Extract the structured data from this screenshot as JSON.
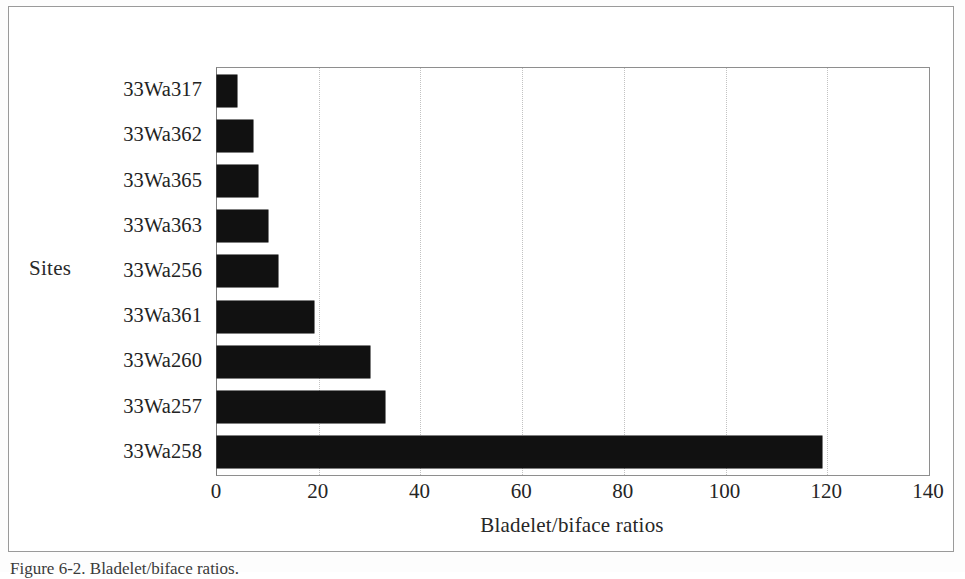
{
  "figure": {
    "caption": "Figure 6-2. Bladelet/biface ratios.",
    "frame_color": "#9a9a9a",
    "bar_color": "#111111",
    "gridline_color": "#c2c2c2",
    "background": "#ffffff"
  },
  "chart_data": {
    "type": "bar",
    "orientation": "horizontal",
    "title": "",
    "xlabel": "Bladelet/biface ratios",
    "ylabel": "Sites",
    "categories": [
      "33Wa317",
      "33Wa362",
      "33Wa365",
      "33Wa363",
      "33Wa256",
      "33Wa361",
      "33Wa260",
      "33Wa257",
      "33Wa258"
    ],
    "values": [
      4,
      7,
      8,
      10,
      12,
      19,
      30,
      33,
      119
    ],
    "xlim": [
      0,
      140
    ],
    "xticks": [
      0,
      20,
      40,
      60,
      80,
      100,
      120,
      140
    ],
    "xtick_labels": [
      "0",
      "20",
      "40",
      "60",
      "80",
      "100",
      "120",
      "140"
    ],
    "grid": true,
    "grid_axis": "x",
    "grid_style": "dotted",
    "legend": false,
    "series": [
      {
        "name": "Bladelet/biface ratio",
        "values": [
          4,
          7,
          8,
          10,
          12,
          19,
          30,
          33,
          119
        ]
      }
    ]
  }
}
